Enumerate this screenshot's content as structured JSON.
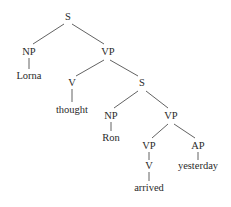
{
  "diagram": {
    "type": "syntax-tree",
    "nodes": [
      {
        "id": "s1",
        "label": "S",
        "x": 68,
        "y": 20
      },
      {
        "id": "np1",
        "label": "NP",
        "x": 29,
        "y": 55
      },
      {
        "id": "lorna",
        "label": "Lorna",
        "x": 29,
        "y": 79
      },
      {
        "id": "vp1",
        "label": "VP",
        "x": 108,
        "y": 55
      },
      {
        "id": "v1",
        "label": "V",
        "x": 72,
        "y": 86
      },
      {
        "id": "thought",
        "label": "thought",
        "x": 72,
        "y": 113
      },
      {
        "id": "s2",
        "label": "S",
        "x": 142,
        "y": 86
      },
      {
        "id": "np2",
        "label": "NP",
        "x": 111,
        "y": 119
      },
      {
        "id": "ron",
        "label": "Ron",
        "x": 111,
        "y": 141
      },
      {
        "id": "vp2",
        "label": "VP",
        "x": 171,
        "y": 119
      },
      {
        "id": "vp3",
        "label": "VP",
        "x": 149,
        "y": 149
      },
      {
        "id": "v2",
        "label": "V",
        "x": 149,
        "y": 169
      },
      {
        "id": "arrived",
        "label": "arrived",
        "x": 149,
        "y": 191
      },
      {
        "id": "ap",
        "label": "AP",
        "x": 198,
        "y": 149
      },
      {
        "id": "yesterday",
        "label": "yesterday",
        "x": 198,
        "y": 169
      }
    ],
    "edges": [
      {
        "from": "s1",
        "to": "np1",
        "x1": 64,
        "y1": 24,
        "x2": 33,
        "y2": 44
      },
      {
        "from": "s1",
        "to": "vp1",
        "x1": 72,
        "y1": 24,
        "x2": 104,
        "y2": 44
      },
      {
        "from": "np1",
        "to": "lorna",
        "x1": 29,
        "y1": 58,
        "x2": 29,
        "y2": 69
      },
      {
        "from": "vp1",
        "to": "v1",
        "x1": 104,
        "y1": 60,
        "x2": 76,
        "y2": 76
      },
      {
        "from": "vp1",
        "to": "s2",
        "x1": 110,
        "y1": 60,
        "x2": 138,
        "y2": 76
      },
      {
        "from": "v1",
        "to": "thought",
        "x1": 72,
        "y1": 89,
        "x2": 72,
        "y2": 102
      },
      {
        "from": "s2",
        "to": "np2",
        "x1": 138,
        "y1": 91,
        "x2": 114,
        "y2": 108
      },
      {
        "from": "s2",
        "to": "vp2",
        "x1": 146,
        "y1": 91,
        "x2": 168,
        "y2": 108
      },
      {
        "from": "np2",
        "to": "ron",
        "x1": 111,
        "y1": 122,
        "x2": 111,
        "y2": 131
      },
      {
        "from": "vp2",
        "to": "vp3",
        "x1": 168,
        "y1": 124,
        "x2": 152,
        "y2": 138
      },
      {
        "from": "vp2",
        "to": "ap",
        "x1": 174,
        "y1": 124,
        "x2": 195,
        "y2": 138
      },
      {
        "from": "vp3",
        "to": "v2",
        "x1": 149,
        "y1": 152,
        "x2": 149,
        "y2": 160
      },
      {
        "from": "ap",
        "to": "yesterday",
        "x1": 198,
        "y1": 152,
        "x2": 198,
        "y2": 160
      },
      {
        "from": "v2",
        "to": "arrived",
        "x1": 149,
        "y1": 172,
        "x2": 149,
        "y2": 181
      }
    ]
  }
}
